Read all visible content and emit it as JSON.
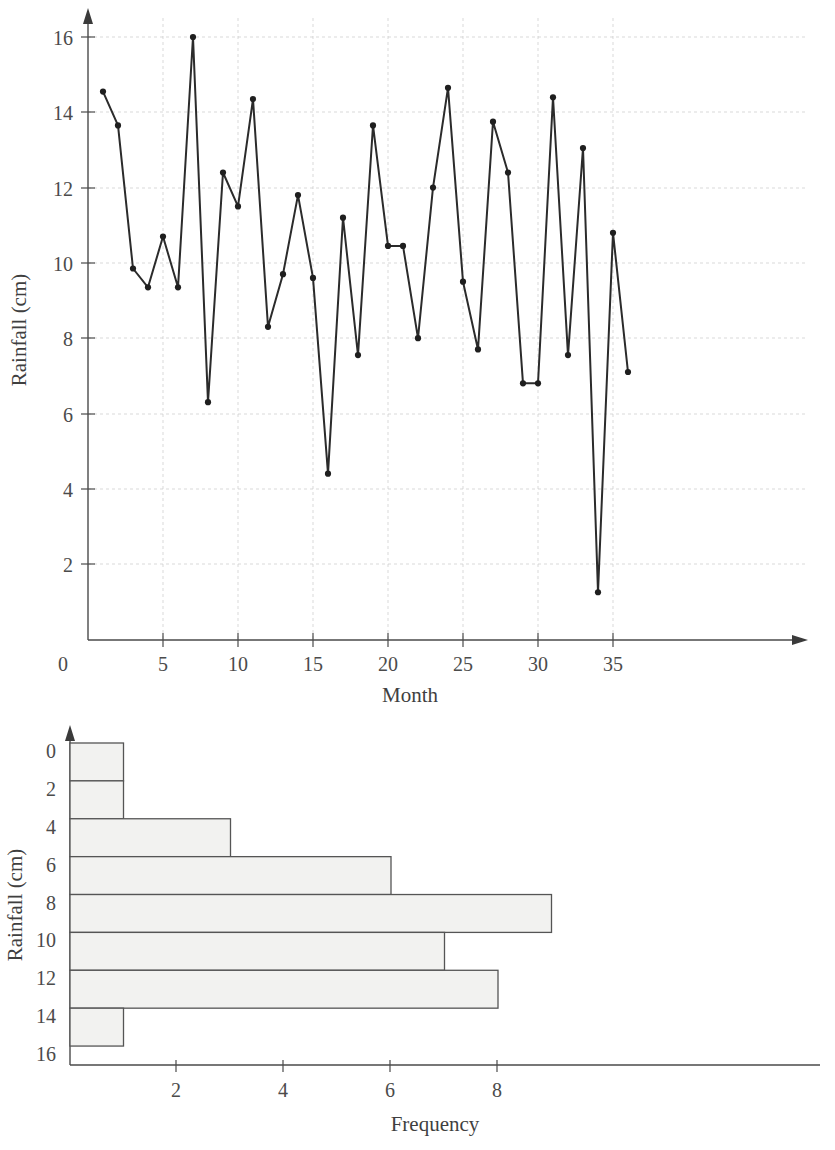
{
  "figure": {
    "panels": [
      "line-chart-rainfall-by-month",
      "histogram-rainfall-frequency"
    ]
  },
  "chart_data": [
    {
      "type": "line",
      "title": "",
      "subtitle": "",
      "xlabel": "Month",
      "ylabel": "Rainfall (cm)",
      "xlim": [
        0,
        38
      ],
      "ylim": [
        0,
        16.8
      ],
      "xticks": [
        0,
        5,
        10,
        15,
        20,
        25,
        30,
        35
      ],
      "xtick_labels": [
        "0",
        "5",
        "10",
        "15",
        "20",
        "25",
        "30",
        "35"
      ],
      "yticks": [
        2,
        4,
        6,
        8,
        10,
        12,
        14,
        16
      ],
      "ytick_labels": [
        "2",
        "4",
        "6",
        "8",
        "10",
        "12",
        "14",
        "16"
      ],
      "grid": true,
      "legend": "none",
      "markers": "filled-circle",
      "x": [
        1,
        2,
        3,
        4,
        5,
        6,
        7,
        8,
        9,
        10,
        11,
        12,
        13,
        14,
        15,
        16,
        17,
        18,
        19,
        20,
        21,
        22,
        23,
        24,
        25,
        26,
        27,
        28,
        29,
        30,
        31,
        32,
        33,
        34,
        35,
        36
      ],
      "values": [
        14.55,
        13.65,
        9.85,
        9.35,
        10.7,
        9.35,
        16.0,
        6.3,
        12.4,
        11.5,
        14.35,
        8.3,
        9.7,
        11.8,
        9.6,
        4.4,
        11.2,
        7.55,
        13.65,
        10.45,
        10.45,
        8.0,
        12.0,
        14.65,
        9.5,
        7.7,
        13.75,
        12.4,
        6.8,
        6.8,
        14.4,
        7.55,
        13.05,
        1.25,
        10.8,
        7.1
      ]
    },
    {
      "type": "bar",
      "orientation": "horizontal",
      "title": "",
      "xlabel": "Frequency",
      "ylabel": "Rainfall (cm)",
      "xlim": [
        0,
        9.8
      ],
      "xticks": [
        2,
        4,
        6,
        8
      ],
      "xtick_labels": [
        "2",
        "4",
        "6",
        "8"
      ],
      "yticks": [
        0,
        2,
        4,
        6,
        8,
        10,
        12,
        14,
        16
      ],
      "ytick_labels": [
        "0",
        "2",
        "4",
        "6",
        "8",
        "10",
        "12",
        "14",
        "16"
      ],
      "grid": false,
      "legend": "none",
      "categories": [
        "0-2",
        "2-4",
        "4-6",
        "6-8",
        "8-10",
        "10-12",
        "12-14",
        "14-16"
      ],
      "bin_edges": [
        0,
        2,
        4,
        6,
        8,
        10,
        12,
        14,
        16
      ],
      "values": [
        1,
        1,
        3,
        6,
        9,
        7,
        8,
        1
      ]
    }
  ],
  "colors": {
    "line": "#2b2b2b",
    "marker": "#1f1f1f",
    "grid": "#c9c9c9",
    "axis": "#4a4a4a",
    "bar_fill": "#f2f2f0",
    "bar_stroke": "#555555",
    "text": "#4b4b4b",
    "background": "#ffffff"
  }
}
